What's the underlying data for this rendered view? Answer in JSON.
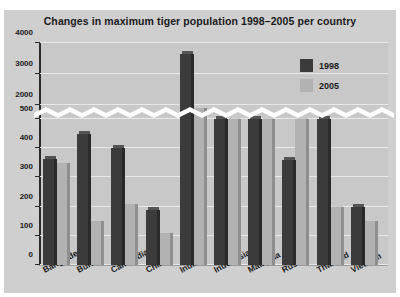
{
  "chart_data": {
    "type": "bar",
    "title": "Changes in maximum tiger population 1998–2005 per country",
    "xlabel": "",
    "ylabel": "",
    "grid": true,
    "legend_position": "top-right",
    "axis_break": {
      "present": true,
      "style": "white-zigzag-band",
      "lower_range": [
        0,
        500
      ],
      "upper_range": [
        2000,
        4000
      ]
    },
    "yticks": [
      0,
      100,
      200,
      300,
      400,
      500,
      2000,
      3000,
      4000
    ],
    "ytick_labels": [
      "0",
      "100",
      "200",
      "300",
      "400",
      "500",
      "2000",
      "3000",
      "4000"
    ],
    "ylim": [
      0,
      4000
    ],
    "categories": [
      "Bangladesh",
      "Burma",
      "Cambodia",
      "China",
      "India",
      "Indonesia",
      "Malaysia",
      "Russia",
      "Thailand",
      "Vietnam"
    ],
    "series": [
      {
        "name": "1998",
        "color": "#3b3b3b",
        "values": [
          362,
          450,
          400,
          190,
          3650,
          500,
          500,
          360,
          500,
          200
        ]
      },
      {
        "name": "2005",
        "color": "#b2b2b2",
        "values": [
          350,
          150,
          210,
          110,
          1900,
          500,
          500,
          500,
          200,
          150
        ]
      }
    ]
  },
  "legend": {
    "items": [
      {
        "label": "1998",
        "color": "#3b3b3b"
      },
      {
        "label": "2005",
        "color": "#b2b2b2"
      }
    ]
  }
}
